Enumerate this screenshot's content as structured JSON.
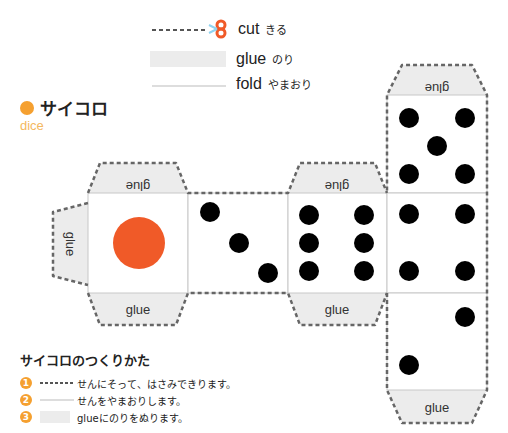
{
  "legend": {
    "cut": {
      "en": "cut",
      "jp": "きる",
      "icon": "scissors-icon",
      "color": "#f05a28"
    },
    "glue": {
      "en": "glue",
      "jp": "のり"
    },
    "fold": {
      "en": "fold",
      "jp": "やまおり"
    }
  },
  "header": {
    "title": "サイコロ",
    "subtitle": "dice",
    "accent": "#f5a030"
  },
  "net": {
    "glue_label": "glue",
    "faces": [
      {
        "value": 1,
        "pip_color": "#f05a28"
      },
      {
        "value": 3
      },
      {
        "value": 6
      },
      {
        "value": 5
      },
      {
        "value": 4
      },
      {
        "value": 2
      }
    ]
  },
  "instructions": {
    "title": "サイコロのつくりかた",
    "steps": [
      {
        "num": "1",
        "text": "せんにそって、はさみできります。"
      },
      {
        "num": "2",
        "text": "せんをやまおりします。"
      },
      {
        "num": "3",
        "text": "glueにのりをぬります。"
      }
    ]
  }
}
